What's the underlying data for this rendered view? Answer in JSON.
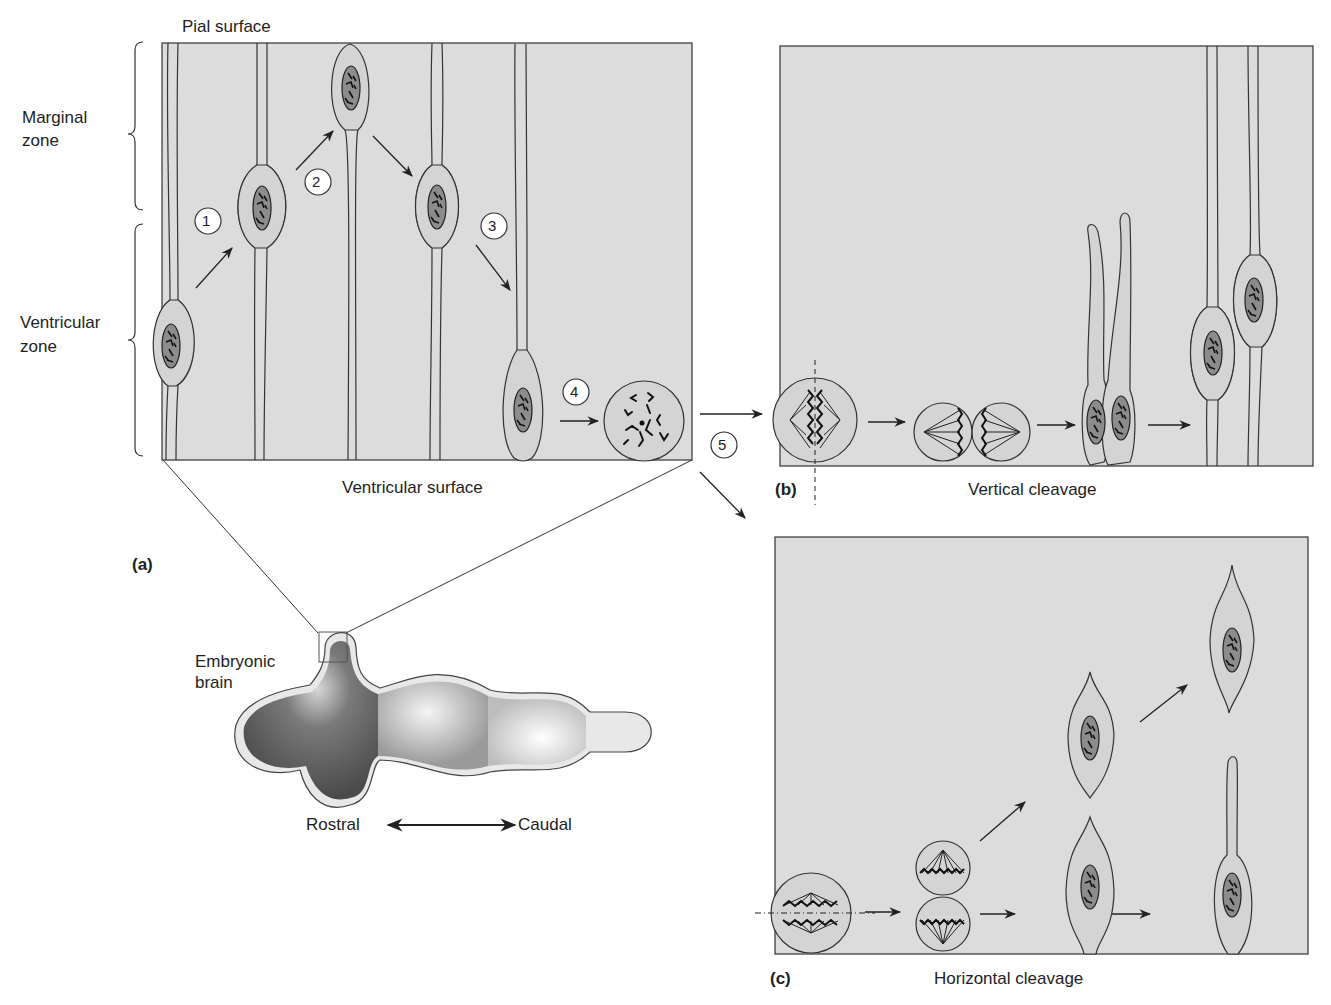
{
  "panel_a": {
    "letter": "(a)",
    "top_label": "Pial surface",
    "bottom_label": "Ventricular surface",
    "zones": [
      {
        "line1": "Marginal",
        "line2": "zone"
      },
      {
        "line1": "Ventricular",
        "line2": "zone"
      }
    ],
    "steps": [
      "1",
      "2",
      "3",
      "4",
      "5"
    ]
  },
  "brain": {
    "label_line1": "Embryonic",
    "label_line2": "brain",
    "axis_left": "Rostral",
    "axis_right": "Caudal"
  },
  "panel_b": {
    "letter": "(b)",
    "caption": "Vertical cleavage"
  },
  "panel_c": {
    "letter": "(c)",
    "caption": "Horizontal cleavage"
  },
  "colors": {
    "panel_fill": "#dcdcdc",
    "cell_fill": "#d4d4d4",
    "nucleus_fill": "#8c8c8c",
    "line": "#2a2a2a",
    "brain_dark": "#5a5a5a",
    "brain_light": "#e6e6e6"
  }
}
